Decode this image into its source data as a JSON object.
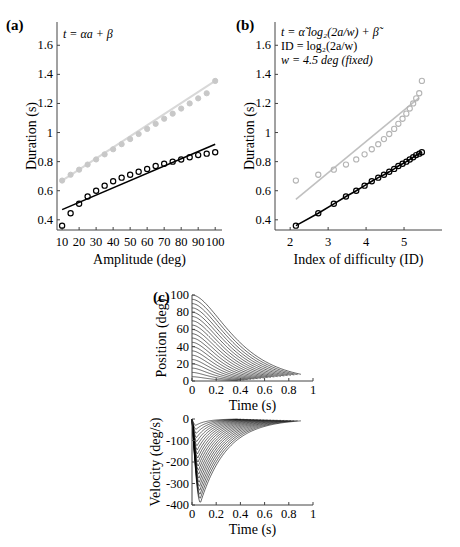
{
  "chart_data": [
    {
      "panel": "(a)",
      "type": "scatter",
      "title": "",
      "annotation": "t = αa + β",
      "xlabel": "Amplitude (deg)",
      "ylabel": "Duration (s)",
      "xlim": [
        7,
        104
      ],
      "ylim": [
        0.33,
        1.76
      ],
      "xticks": [
        10,
        20,
        30,
        40,
        50,
        60,
        70,
        80,
        90,
        100
      ],
      "yticks": [
        0.4,
        0.6,
        0.8,
        1,
        1.2,
        1.4,
        1.6
      ],
      "ytick_labels": [
        "0.4",
        "0.6",
        "0.8",
        "1",
        "1.2",
        "1.4",
        "1.6"
      ],
      "x": [
        10,
        15,
        20,
        25,
        30,
        35,
        40,
        45,
        50,
        55,
        60,
        65,
        70,
        75,
        80,
        85,
        90,
        95,
        100
      ],
      "series": [
        {
          "name": "gray (filled markers + fit line)",
          "color": "#c8c8c8",
          "marker": "filled-circle",
          "values": [
            0.67,
            0.71,
            0.745,
            0.78,
            0.815,
            0.85,
            0.885,
            0.92,
            0.955,
            0.99,
            1.025,
            1.06,
            1.095,
            1.13,
            1.165,
            1.2,
            1.235,
            1.27,
            1.355
          ],
          "fit_line": {
            "x": [
              10,
              100
            ],
            "y": [
              0.67,
              1.355
            ]
          }
        },
        {
          "name": "black (open circles + fit line)",
          "color": "#000000",
          "marker": "open-circle",
          "values": [
            0.36,
            0.445,
            0.51,
            0.56,
            0.6,
            0.635,
            0.665,
            0.69,
            0.71,
            0.73,
            0.75,
            0.77,
            0.785,
            0.8,
            0.815,
            0.83,
            0.845,
            0.855,
            0.865
          ],
          "fit_line": {
            "x": [
              10,
              100
            ],
            "y": [
              0.47,
              0.92
            ]
          }
        }
      ],
      "grid": false
    },
    {
      "panel": "(b)",
      "type": "scatter",
      "annotation": [
        "t = α̃ log₂(2a/w) + β̃",
        "ID = log₂(2a/w)",
        "w = 4.5 deg (fixed)"
      ],
      "xlabel": "Index of difficulty (ID)",
      "ylabel": "Duration (s)",
      "xlim": [
        1.6,
        6.0
      ],
      "ylim": [
        0.33,
        1.76
      ],
      "xticks": [
        2,
        3,
        4,
        5
      ],
      "yticks": [
        0.4,
        0.6,
        0.8,
        1,
        1.2,
        1.4,
        1.6
      ],
      "ytick_labels": [
        "0.4",
        "0.6",
        "0.8",
        "1",
        "1.2",
        "1.4",
        "1.6"
      ],
      "x": [
        2.15,
        2.74,
        3.15,
        3.47,
        3.74,
        3.96,
        4.15,
        4.32,
        4.47,
        4.61,
        4.74,
        4.85,
        4.96,
        5.06,
        5.15,
        5.24,
        5.32,
        5.4,
        5.47
      ],
      "series": [
        {
          "name": "gray (open circles + fit line)",
          "color": "#b4b4b4",
          "marker": "open-circle",
          "values": [
            0.67,
            0.71,
            0.745,
            0.78,
            0.815,
            0.85,
            0.885,
            0.92,
            0.955,
            0.99,
            1.025,
            1.06,
            1.095,
            1.13,
            1.165,
            1.2,
            1.235,
            1.27,
            1.355
          ],
          "fit_line": {
            "x": [
              2.15,
              5.4
            ],
            "y": [
              0.54,
              1.24
            ]
          }
        },
        {
          "name": "black (open circles + line)",
          "color": "#000000",
          "marker": "open-circle",
          "values": [
            0.36,
            0.445,
            0.51,
            0.56,
            0.6,
            0.635,
            0.665,
            0.69,
            0.71,
            0.73,
            0.75,
            0.77,
            0.785,
            0.8,
            0.815,
            0.83,
            0.845,
            0.855,
            0.865
          ],
          "fit_line": {
            "x": [
              2.15,
              5.47
            ],
            "y": [
              0.36,
              0.865
            ]
          }
        }
      ],
      "grid": false
    },
    {
      "panel": "(c) top",
      "type": "line",
      "xlabel": "Time (s)",
      "ylabel": "Position (deg)",
      "xlim": [
        0,
        1
      ],
      "ylim": [
        0,
        100
      ],
      "xticks": [
        0,
        0.2,
        0.4,
        0.6,
        0.8,
        1
      ],
      "xtick_labels": [
        "0",
        "0.2",
        "0.4",
        "0.6",
        "0.8",
        "1"
      ],
      "yticks": [
        0,
        20,
        40,
        60,
        80,
        100
      ],
      "amplitudes": [
        5,
        10,
        15,
        20,
        25,
        30,
        35,
        40,
        45,
        50,
        55,
        60,
        65,
        70,
        75,
        80,
        85,
        90,
        95,
        100
      ],
      "description": "Family of position traces decaying from each amplitude toward 0; larger amplitudes take longer (≈0.9 s for 100 deg)."
    },
    {
      "panel": "(c) bottom",
      "type": "line",
      "xlabel": "Time (s)",
      "ylabel": "Velocity (deg/s)",
      "xlim": [
        0,
        1
      ],
      "ylim": [
        -400,
        0
      ],
      "xticks": [
        0,
        0.2,
        0.4,
        0.6,
        0.8,
        1
      ],
      "xtick_labels": [
        "0",
        "0.2",
        "0.4",
        "0.6",
        "0.8",
        "1"
      ],
      "yticks": [
        -400,
        -300,
        -200,
        -100,
        0
      ],
      "peak_velocity_min": -380,
      "peak_time": 0.07,
      "description": "Family of velocity traces: sharp negative peak near t≈0.05–0.08 s, deeper for larger amplitudes (down to ≈ -380 deg/s), then relaxing to 0."
    }
  ],
  "labels": {
    "a": "(a)",
    "b": "(b)",
    "c": "(c)"
  }
}
